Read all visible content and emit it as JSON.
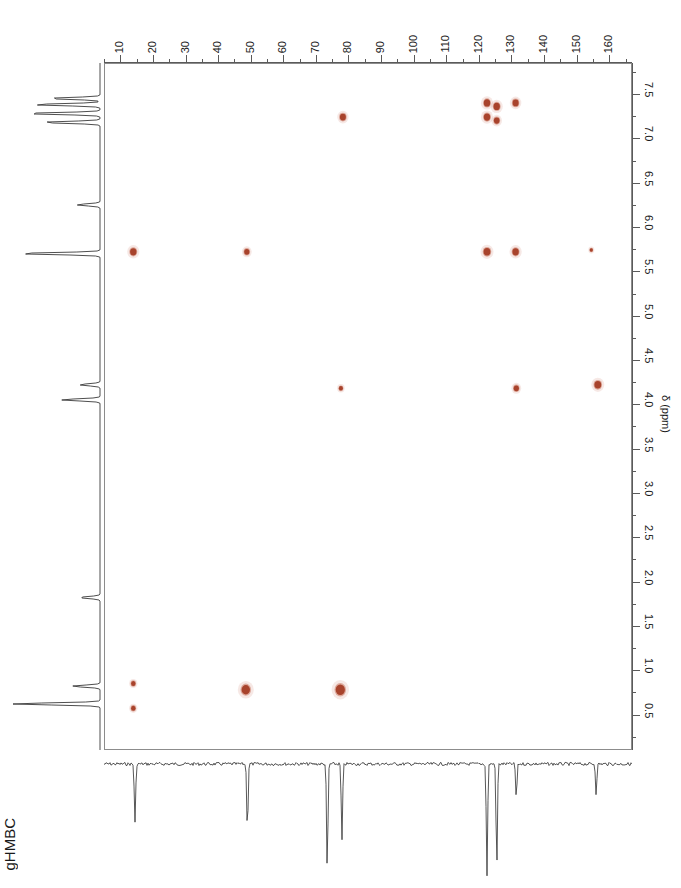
{
  "experiment": {
    "label": "gHMBC",
    "top_title": ""
  },
  "axes": {
    "x": {
      "label": "",
      "unit": "ppm",
      "ticks": [
        10,
        20,
        30,
        40,
        50,
        60,
        70,
        80,
        90,
        100,
        110,
        120,
        130,
        140,
        150,
        160
      ],
      "min": 5,
      "max": 167,
      "direction": "left-to-right"
    },
    "y": {
      "label": "δ (ppm)",
      "unit": "ppm",
      "ticks": [
        0.5,
        1.0,
        1.5,
        2.0,
        2.5,
        3.0,
        3.5,
        4.0,
        4.5,
        5.0,
        5.5,
        6.0,
        6.5,
        7.0,
        7.5
      ],
      "min": 0.1,
      "max": 7.85,
      "direction": "top-to-bottom"
    }
  },
  "colors": {
    "peak": "#a8432c",
    "peak_light": "#c9735c",
    "frame": "#8c8c8c",
    "trace": "#3a3a3a",
    "text": "#1a1a1a"
  },
  "chart_data": {
    "type": "scatter",
    "title": "gHMBC",
    "xlabel": "δ (ppm) 13C",
    "ylabel": "δ (ppm)",
    "xlim": [
      5,
      167
    ],
    "ylim": [
      7.85,
      0.1
    ],
    "grid": false,
    "legend": "none",
    "series": [
      {
        "name": "HMBC cross peaks",
        "points": [
          {
            "x": 14.0,
            "y": 0.57,
            "r": 2.2,
            "intensity": "weak"
          },
          {
            "x": 14.0,
            "y": 0.85,
            "r": 2.2,
            "intensity": "weak"
          },
          {
            "x": 48.5,
            "y": 0.78,
            "r": 4.2,
            "intensity": "strong"
          },
          {
            "x": 77.5,
            "y": 0.78,
            "r": 4.6,
            "intensity": "strong"
          },
          {
            "x": 77.7,
            "y": 4.18,
            "r": 2.0,
            "intensity": "weak"
          },
          {
            "x": 131.5,
            "y": 4.18,
            "r": 2.6,
            "intensity": "medium"
          },
          {
            "x": 156.5,
            "y": 4.22,
            "r": 3.4,
            "intensity": "medium"
          },
          {
            "x": 14.0,
            "y": 5.72,
            "r": 3.2,
            "intensity": "medium"
          },
          {
            "x": 48.8,
            "y": 5.72,
            "r": 2.6,
            "intensity": "medium"
          },
          {
            "x": 122.5,
            "y": 5.72,
            "r": 3.4,
            "intensity": "medium"
          },
          {
            "x": 131.3,
            "y": 5.72,
            "r": 3.2,
            "intensity": "medium"
          },
          {
            "x": 154.5,
            "y": 5.74,
            "r": 1.6,
            "intensity": "very-weak"
          },
          {
            "x": 78.3,
            "y": 7.24,
            "r": 3.0,
            "intensity": "medium"
          },
          {
            "x": 122.5,
            "y": 7.24,
            "r": 3.2,
            "intensity": "strong"
          },
          {
            "x": 122.5,
            "y": 7.4,
            "r": 3.2,
            "intensity": "strong"
          },
          {
            "x": 125.5,
            "y": 7.2,
            "r": 2.8,
            "intensity": "medium"
          },
          {
            "x": 125.5,
            "y": 7.36,
            "r": 3.2,
            "intensity": "strong"
          },
          {
            "x": 131.3,
            "y": 7.4,
            "r": 3.0,
            "intensity": "medium"
          }
        ]
      }
    ],
    "proton_projection": {
      "axis": "y",
      "peaks": [
        {
          "ppm": 0.62,
          "height": 0.95
        },
        {
          "ppm": 0.82,
          "height": 0.3
        },
        {
          "ppm": 1.82,
          "height": 0.22
        },
        {
          "ppm": 4.05,
          "height": 0.42
        },
        {
          "ppm": 4.22,
          "height": 0.22
        },
        {
          "ppm": 5.7,
          "height": 0.88
        },
        {
          "ppm": 6.25,
          "height": 0.25
        },
        {
          "ppm": 7.18,
          "height": 0.62
        },
        {
          "ppm": 7.28,
          "height": 0.8
        },
        {
          "ppm": 7.38,
          "height": 0.72
        },
        {
          "ppm": 7.45,
          "height": 0.55
        }
      ]
    },
    "carbon_projection": {
      "axis": "x",
      "direction": "down",
      "peaks": [
        {
          "ppm": 14.5,
          "depth": 0.52
        },
        {
          "ppm": 49.0,
          "depth": 0.6
        },
        {
          "ppm": 73.5,
          "depth": 0.95
        },
        {
          "ppm": 78.0,
          "depth": 0.68
        },
        {
          "ppm": 122.5,
          "depth": 1.0
        },
        {
          "ppm": 125.5,
          "depth": 0.92
        },
        {
          "ppm": 131.5,
          "depth": 0.3
        },
        {
          "ppm": 156.0,
          "depth": 0.28
        }
      ]
    }
  }
}
